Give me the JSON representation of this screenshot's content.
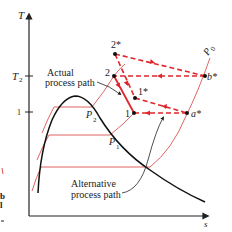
{
  "diagram": {
    "type": "T-s diagram (temperature vs entropy)",
    "axes": {
      "y_label": "T",
      "x_label": "s"
    },
    "ticks": {
      "t2": "T",
      "t2_sub": "2",
      "t1": "T",
      "t1_sub": "1"
    },
    "points": {
      "p2star": "2*",
      "p2": "2",
      "p1star": "1*",
      "p1": "1",
      "astar": "a*",
      "bstar": "b*"
    },
    "isobars": {
      "p2": "P",
      "p2_sub": "2",
      "p1": "P",
      "p1_sub": "1",
      "p0": "P",
      "p0_sub": "0"
    },
    "annotations": {
      "actual_line1": "Actual",
      "actual_line2": "process path",
      "alt_line1": "Alternative",
      "alt_line2": "process path"
    },
    "margin_fragments": [
      "b",
      "l"
    ],
    "colors": {
      "isobar": "#d9534f",
      "dashed_path": "#e0252b",
      "dome": "#111111",
      "axis": "#222222",
      "point": "#111111"
    }
  }
}
